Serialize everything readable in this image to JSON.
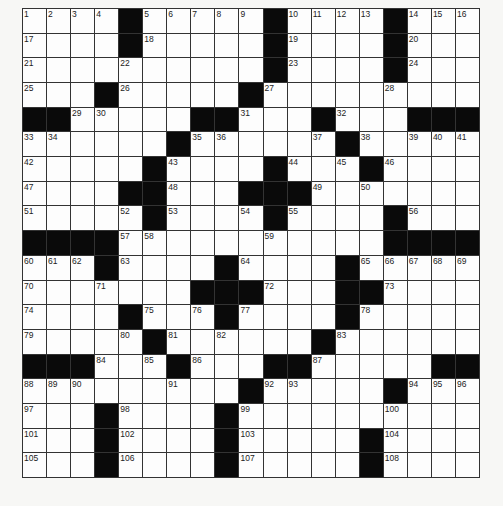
{
  "puzzle": {
    "rows": 19,
    "cols": 19,
    "layout": [
      "....#.....#....#...",
      "....#.....#....#...",
      "..........#....#...",
      "...#.....#.........",
      "##.....##...#...###",
      "......#......#.....",
      ".....#....#...#....",
      "....##...###.......",
      ".....#....#....#...",
      "####...........####",
      "...#....#....#.....",
      ".......###...##....",
      "....#...#....#.....",
      ".....#......#......",
      "###...#...##.....##",
      ".........#.....#...",
      "...#....#..........",
      "...#....#.....#....",
      "...#....#.....#...."
    ],
    "numbers": [
      {
        "r": 0,
        "c": 0,
        "n": "1"
      },
      {
        "r": 0,
        "c": 1,
        "n": "2"
      },
      {
        "r": 0,
        "c": 2,
        "n": "3"
      },
      {
        "r": 0,
        "c": 3,
        "n": "4"
      },
      {
        "r": 0,
        "c": 5,
        "n": "5"
      },
      {
        "r": 0,
        "c": 6,
        "n": "6"
      },
      {
        "r": 0,
        "c": 7,
        "n": "7"
      },
      {
        "r": 0,
        "c": 8,
        "n": "8"
      },
      {
        "r": 0,
        "c": 9,
        "n": "9"
      },
      {
        "r": 0,
        "c": 11,
        "n": "10"
      },
      {
        "r": 0,
        "c": 12,
        "n": "11"
      },
      {
        "r": 0,
        "c": 13,
        "n": "12"
      },
      {
        "r": 0,
        "c": 14,
        "n": "13"
      },
      {
        "r": 0,
        "c": 16,
        "n": "14"
      },
      {
        "r": 0,
        "c": 17,
        "n": "15"
      },
      {
        "r": 0,
        "c": 18,
        "n": "16"
      },
      {
        "r": 1,
        "c": 0,
        "n": "17"
      },
      {
        "r": 1,
        "c": 5,
        "n": "18"
      },
      {
        "r": 1,
        "c": 11,
        "n": "19"
      },
      {
        "r": 1,
        "c": 16,
        "n": "20"
      },
      {
        "r": 2,
        "c": 0,
        "n": "21"
      },
      {
        "r": 2,
        "c": 4,
        "n": "22"
      },
      {
        "r": 2,
        "c": 11,
        "n": "23"
      },
      {
        "r": 2,
        "c": 16,
        "n": "24"
      },
      {
        "r": 3,
        "c": 0,
        "n": "25"
      },
      {
        "r": 3,
        "c": 4,
        "n": "26"
      },
      {
        "r": 3,
        "c": 10,
        "n": "27"
      },
      {
        "r": 3,
        "c": 15,
        "n": "28"
      },
      {
        "r": 4,
        "c": 2,
        "n": "29"
      },
      {
        "r": 4,
        "c": 3,
        "n": "30"
      },
      {
        "r": 4,
        "c": 9,
        "n": "31"
      },
      {
        "r": 4,
        "c": 13,
        "n": "32"
      },
      {
        "r": 5,
        "c": 0,
        "n": "33"
      },
      {
        "r": 5,
        "c": 1,
        "n": "34"
      },
      {
        "r": 5,
        "c": 7,
        "n": "35"
      },
      {
        "r": 5,
        "c": 8,
        "n": "36"
      },
      {
        "r": 5,
        "c": 12,
        "n": "37"
      },
      {
        "r": 5,
        "c": 14,
        "n": "38"
      },
      {
        "r": 5,
        "c": 16,
        "n": "39"
      },
      {
        "r": 5,
        "c": 17,
        "n": "40"
      },
      {
        "r": 5,
        "c": 18,
        "n": "41"
      },
      {
        "r": 6,
        "c": 0,
        "n": "42"
      },
      {
        "r": 6,
        "c": 6,
        "n": "43"
      },
      {
        "r": 6,
        "c": 11,
        "n": "44"
      },
      {
        "r": 6,
        "c": 13,
        "n": "45"
      },
      {
        "r": 6,
        "c": 15,
        "n": "46"
      },
      {
        "r": 7,
        "c": 0,
        "n": "47"
      },
      {
        "r": 7,
        "c": 6,
        "n": "48"
      },
      {
        "r": 7,
        "c": 12,
        "n": "49"
      },
      {
        "r": 7,
        "c": 14,
        "n": "50"
      },
      {
        "r": 8,
        "c": 0,
        "n": "51"
      },
      {
        "r": 8,
        "c": 4,
        "n": "52"
      },
      {
        "r": 8,
        "c": 6,
        "n": "53"
      },
      {
        "r": 8,
        "c": 9,
        "n": "54"
      },
      {
        "r": 8,
        "c": 11,
        "n": "55"
      },
      {
        "r": 8,
        "c": 16,
        "n": "56"
      },
      {
        "r": 9,
        "c": 4,
        "n": "57"
      },
      {
        "r": 9,
        "c": 5,
        "n": "58"
      },
      {
        "r": 9,
        "c": 10,
        "n": "59"
      },
      {
        "r": 10,
        "c": 0,
        "n": "60"
      },
      {
        "r": 10,
        "c": 1,
        "n": "61"
      },
      {
        "r": 10,
        "c": 2,
        "n": "62"
      },
      {
        "r": 10,
        "c": 4,
        "n": "63"
      },
      {
        "r": 10,
        "c": 9,
        "n": "64"
      },
      {
        "r": 10,
        "c": 14,
        "n": "65"
      },
      {
        "r": 10,
        "c": 15,
        "n": "66"
      },
      {
        "r": 10,
        "c": 16,
        "n": "67"
      },
      {
        "r": 10,
        "c": 17,
        "n": "68"
      },
      {
        "r": 10,
        "c": 18,
        "n": "69"
      },
      {
        "r": 11,
        "c": 0,
        "n": "70"
      },
      {
        "r": 11,
        "c": 3,
        "n": "71"
      },
      {
        "r": 11,
        "c": 10,
        "n": "72"
      },
      {
        "r": 11,
        "c": 15,
        "n": "73"
      },
      {
        "r": 12,
        "c": 0,
        "n": "74"
      },
      {
        "r": 12,
        "c": 5,
        "n": "75"
      },
      {
        "r": 12,
        "c": 7,
        "n": "76"
      },
      {
        "r": 12,
        "c": 9,
        "n": "77"
      },
      {
        "r": 12,
        "c": 14,
        "n": "78"
      },
      {
        "r": 13,
        "c": 0,
        "n": "79"
      },
      {
        "r": 13,
        "c": 4,
        "n": "80"
      },
      {
        "r": 13,
        "c": 6,
        "n": "81"
      },
      {
        "r": 13,
        "c": 8,
        "n": "82"
      },
      {
        "r": 13,
        "c": 13,
        "n": "83"
      },
      {
        "r": 14,
        "c": 3,
        "n": "84"
      },
      {
        "r": 14,
        "c": 5,
        "n": "85"
      },
      {
        "r": 14,
        "c": 7,
        "n": "86"
      },
      {
        "r": 14,
        "c": 12,
        "n": "87"
      },
      {
        "r": 15,
        "c": 0,
        "n": "88"
      },
      {
        "r": 15,
        "c": 1,
        "n": "89"
      },
      {
        "r": 15,
        "c": 2,
        "n": "90"
      },
      {
        "r": 15,
        "c": 6,
        "n": "91"
      },
      {
        "r": 15,
        "c": 10,
        "n": "92"
      },
      {
        "r": 15,
        "c": 11,
        "n": "93"
      },
      {
        "r": 15,
        "c": 16,
        "n": "94"
      },
      {
        "r": 15,
        "c": 17,
        "n": "95"
      },
      {
        "r": 15,
        "c": 18,
        "n": "96"
      },
      {
        "r": 16,
        "c": 0,
        "n": "97"
      },
      {
        "r": 16,
        "c": 4,
        "n": "98"
      },
      {
        "r": 16,
        "c": 9,
        "n": "99"
      },
      {
        "r": 16,
        "c": 15,
        "n": "100"
      },
      {
        "r": 17,
        "c": 0,
        "n": "101"
      },
      {
        "r": 17,
        "c": 4,
        "n": "102"
      },
      {
        "r": 17,
        "c": 9,
        "n": "103"
      },
      {
        "r": 17,
        "c": 15,
        "n": "104"
      },
      {
        "r": 18,
        "c": 0,
        "n": "105"
      },
      {
        "r": 18,
        "c": 4,
        "n": "106"
      },
      {
        "r": 18,
        "c": 9,
        "n": "107"
      },
      {
        "r": 18,
        "c": 15,
        "n": "108"
      }
    ]
  }
}
